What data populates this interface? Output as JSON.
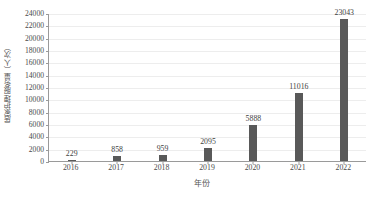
{
  "chart_data": {
    "type": "bar",
    "title": "",
    "subtitle": "",
    "xlabel": "年份",
    "ylabel": "居家护理服务量（人次）",
    "categories": [
      "2016",
      "2017",
      "2018",
      "2019",
      "2020",
      "2021",
      "2022"
    ],
    "values": [
      229,
      858,
      959,
      2095,
      5888,
      11016,
      23043
    ],
    "series": [
      {
        "name": "居家护理服务量",
        "values": [
          229,
          858,
          959,
          2095,
          5888,
          11016,
          23043
        ]
      }
    ],
    "data_labels": [
      "229",
      "858",
      "959",
      "2095",
      "5888",
      "11016",
      "23043"
    ],
    "ylim": [
      0,
      24000
    ],
    "y_ticks": [
      0,
      2000,
      4000,
      6000,
      8000,
      10000,
      12000,
      14000,
      16000,
      18000,
      20000,
      22000,
      24000
    ],
    "y_tick_labels": [
      "0",
      "2000",
      "4000",
      "6000",
      "8000",
      "10000",
      "12000",
      "14000",
      "16000",
      "18000",
      "20000",
      "22000",
      "24000"
    ],
    "grid": true,
    "grid_axis": "y",
    "legend": false,
    "legend_position": "none",
    "bar_color": "#595959",
    "grid_color": "#ededed",
    "axis_color": "#9a9a9a",
    "text_color": "#4a4a4a",
    "background_color": "#ffffff",
    "annotations": []
  },
  "axes": {
    "y_title": "居家护理服务量（人次）",
    "x_title": "年份"
  }
}
